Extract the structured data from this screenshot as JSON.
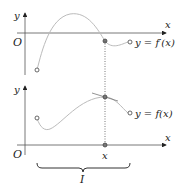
{
  "top_graph": {
    "y_label": "y",
    "x_label": "x",
    "origin_label": "O",
    "curve_label": "y = f′(x)"
  },
  "bottom_graph": {
    "y_label": "y",
    "x_label": "x",
    "origin_label": "O",
    "curve_label": "y = f(x)",
    "point_label": "x",
    "interval_label": "I"
  },
  "colors": {
    "axis": "#555555",
    "curve": "#bbbbbb",
    "text": "#222222"
  }
}
